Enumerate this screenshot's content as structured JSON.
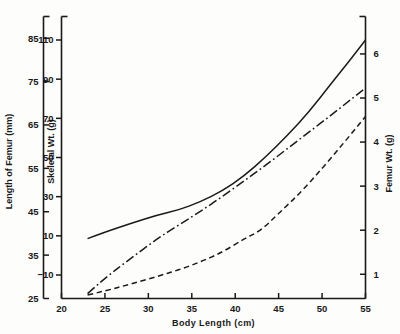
{
  "chart_data": {
    "type": "line",
    "title": "",
    "subtitle": "",
    "xlabel": "Body  Length  (cm)",
    "xlim": [
      20,
      55
    ],
    "xticks": [
      20,
      25,
      30,
      35,
      40,
      45,
      50,
      55
    ],
    "xticklabels": [
      "20",
      "25",
      "30",
      "35",
      "40",
      "45",
      "50",
      "55"
    ],
    "grid": false,
    "legend": "none",
    "axes": [
      {
        "id": "femur-length-axis",
        "position": "left-outer",
        "label": "Length of Femur (mm)",
        "lim": [
          25,
          90
        ],
        "ticks": [
          25,
          35,
          45,
          55,
          65,
          75,
          85
        ],
        "ticklabels": [
          "25",
          "35",
          "45",
          "55",
          "65",
          "75",
          "85"
        ]
      },
      {
        "id": "skeletal-weight-axis",
        "position": "left-inner",
        "label": "Skeletal Wt. (g)",
        "lim": [
          -22,
          122
        ],
        "ticks": [
          -10,
          10,
          30,
          50,
          70,
          90,
          110
        ],
        "ticklabels": [
          "−10",
          "10",
          "30",
          "50",
          "70",
          "90",
          "110"
        ]
      },
      {
        "id": "femur-weight-axis",
        "position": "right",
        "label": "Femur Wt. (g)",
        "lim": [
          0.45,
          6.85
        ],
        "ticks": [
          1,
          2,
          3,
          4,
          5,
          6
        ],
        "ticklabels": [
          "1",
          "2",
          "3",
          "4",
          "5",
          "6"
        ]
      }
    ],
    "series": [
      {
        "name": "Length of Femur",
        "axis": "femur-length-axis",
        "style": "solid",
        "color": "#1a1a1a",
        "x": [
          23,
          25,
          28,
          31,
          33.5,
          36,
          38.5,
          41,
          43.5,
          46,
          48.5,
          51,
          53,
          55
        ],
        "y": [
          38.8,
          40.3,
          42.3,
          44.2,
          45.4,
          47.3,
          49.8,
          53.2,
          57.6,
          62.6,
          68.0,
          74.4,
          79.4,
          84.6
        ]
      },
      {
        "name": "Skeletal Wt.",
        "axis": "skeletal-weight-axis",
        "style": "dashdot",
        "color": "#1a1a1a",
        "x": [
          23,
          25,
          28,
          31,
          33.5,
          36,
          38.5,
          41,
          43.5,
          46,
          48.5,
          51,
          53,
          55
        ],
        "y": [
          -19.5,
          -11.5,
          -1.5,
          8.5,
          15.5,
          22.5,
          30.0,
          38.0,
          46.0,
          54.5,
          63.0,
          71.5,
          78.5,
          85.5
        ]
      },
      {
        "name": "Femur Wt.",
        "axis": "femur-weight-axis",
        "style": "dashed",
        "color": "#1a1a1a",
        "x": [
          23,
          25,
          28,
          31,
          33.5,
          36,
          38.5,
          41,
          43,
          45,
          47.5,
          50,
          52.5,
          55
        ],
        "y": [
          0.53,
          0.62,
          0.78,
          0.95,
          1.1,
          1.28,
          1.5,
          1.8,
          2.0,
          2.38,
          2.85,
          3.4,
          3.98,
          4.58
        ]
      }
    ]
  },
  "colors": {
    "line": "#1a1a1a",
    "background": "#fdfdfc",
    "text": "#191919"
  }
}
